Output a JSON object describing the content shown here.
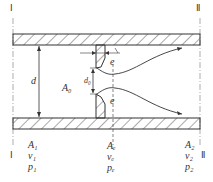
{
  "diagram": {
    "section_left_marker": "Ⅰ",
    "section_right_marker": "Ⅱ",
    "pipe_diameter_label": "d",
    "orifice_area_label": "A₀",
    "orifice_diameter_label": "d₀",
    "vena_contracta_label": "e",
    "section1": {
      "area": "A₁",
      "velocity": "v₁",
      "pressure": "p₁"
    },
    "section_e": {
      "area": "Aₑ",
      "velocity": "vₑ",
      "pressure": "pₑ"
    },
    "section2": {
      "area": "A₂",
      "velocity": "v₂",
      "pressure": "p₂"
    }
  }
}
